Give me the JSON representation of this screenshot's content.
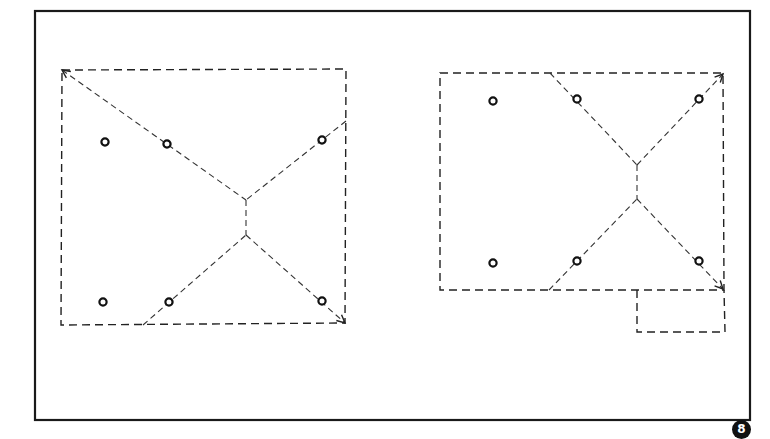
{
  "figure": {
    "colors": {
      "ink": "#222222",
      "background": "#ffffff"
    },
    "outer_frame": {
      "x": 35,
      "y": 11,
      "width": 715,
      "height": 409
    },
    "badge_label": "8",
    "plans": [
      {
        "id": "plan-left",
        "outline": [
          [
            62,
            70
          ],
          [
            346,
            69
          ],
          [
            345,
            323
          ],
          [
            61,
            325
          ]
        ],
        "ridge_lines": [
          [
            [
              62,
              70
            ],
            [
              246,
              200
            ]
          ],
          [
            [
              346,
              121
            ],
            [
              246,
              200
            ]
          ],
          [
            [
              246,
              200
            ],
            [
              246,
              235
            ]
          ],
          [
            [
              143,
              325
            ],
            [
              246,
              235
            ]
          ],
          [
            [
              246,
              235
            ],
            [
              345,
              323
            ]
          ]
        ],
        "arrowheads": [
          {
            "at": [
              62,
              70
            ],
            "from": [
              246,
              200
            ]
          },
          {
            "at": [
              345,
              323
            ],
            "from": [
              246,
              235
            ]
          }
        ],
        "posts": [
          [
            105,
            142
          ],
          [
            167,
            144
          ],
          [
            322,
            140
          ],
          [
            103,
            302
          ],
          [
            169,
            302
          ],
          [
            322,
            301
          ]
        ]
      },
      {
        "id": "plan-right",
        "outline": [
          [
            440,
            73
          ],
          [
            723,
            73
          ],
          [
            724,
            290
          ],
          [
            440,
            290
          ]
        ],
        "extension": [
          [
            637,
            290
          ],
          [
            637,
            332
          ],
          [
            725,
            332
          ],
          [
            724,
            290
          ]
        ],
        "ridge_lines": [
          [
            [
              550,
              73
            ],
            [
              637,
              165
            ]
          ],
          [
            [
              637,
              165
            ],
            [
              723,
              74
            ]
          ],
          [
            [
              637,
              165
            ],
            [
              637,
              199
            ]
          ],
          [
            [
              549,
              290
            ],
            [
              637,
              199
            ]
          ],
          [
            [
              637,
              199
            ],
            [
              723,
              289
            ]
          ]
        ],
        "arrowheads": [
          {
            "at": [
              723,
              74
            ],
            "from": [
              637,
              165
            ]
          },
          {
            "at": [
              723,
              289
            ],
            "from": [
              637,
              199
            ]
          }
        ],
        "posts": [
          [
            493,
            101
          ],
          [
            577,
            99
          ],
          [
            699,
            99
          ],
          [
            493,
            263
          ],
          [
            577,
            261
          ],
          [
            699,
            261
          ]
        ]
      }
    ]
  }
}
